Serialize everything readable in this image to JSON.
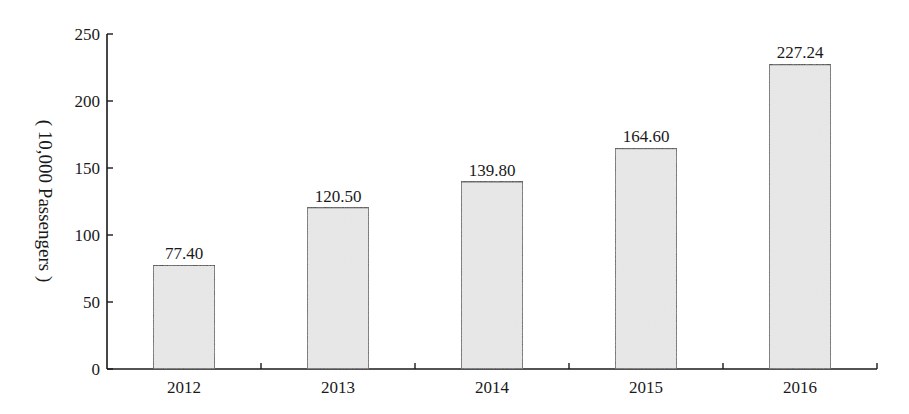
{
  "chart_data": {
    "type": "bar",
    "title": "",
    "xlabel": "",
    "ylabel": "( 10,000 Passengers )",
    "categories": [
      "2012",
      "2013",
      "2014",
      "2015",
      "2016"
    ],
    "values": [
      77.4,
      120.5,
      139.8,
      164.6,
      227.24
    ],
    "data_labels": [
      "77.40",
      "120.50",
      "139.80",
      "164.60",
      "227.24"
    ],
    "ylim": [
      0,
      250
    ],
    "yticks": [
      0,
      50,
      100,
      150,
      200,
      250
    ],
    "grid": false,
    "legend": null,
    "bar_fill": "#e6e6e6",
    "bar_stroke": "#1a1a1a"
  }
}
